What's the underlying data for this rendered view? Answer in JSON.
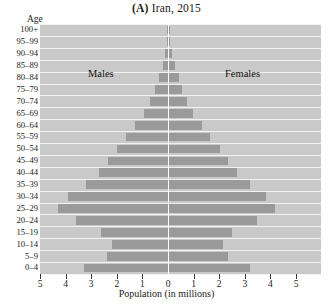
{
  "chart_data": {
    "type": "bar",
    "subtype": "population-pyramid",
    "title": "(A) Iran, 2015",
    "title_tag": "(A)",
    "title_rest": " Iran, 2015",
    "xlabel": "Population (in millions)",
    "ylabel": "Age",
    "xlim": [
      -5,
      5
    ],
    "xticks": [
      5,
      4,
      3,
      2,
      1,
      0,
      1,
      2,
      3,
      4,
      5
    ],
    "grid": true,
    "legend_position": "inside-plot",
    "categories": [
      "0–4",
      "5–9",
      "10–14",
      "15–19",
      "20–24",
      "25–29",
      "30–34",
      "35–39",
      "40–44",
      "45–49",
      "50–54",
      "55–59",
      "60–64",
      "65–69",
      "70–74",
      "75–79",
      "80–84",
      "85–89",
      "90–94",
      "95–99",
      "100+"
    ],
    "series": [
      {
        "name": "Males",
        "values": [
          3.3,
          2.4,
          2.2,
          2.6,
          3.6,
          4.3,
          3.9,
          3.2,
          2.7,
          2.35,
          2.0,
          1.65,
          1.3,
          0.95,
          0.7,
          0.5,
          0.36,
          0.2,
          0.1,
          0.04,
          0.01
        ]
      },
      {
        "name": "Females",
        "values": [
          3.15,
          2.3,
          2.1,
          2.45,
          3.45,
          4.15,
          3.8,
          3.15,
          2.65,
          2.3,
          1.98,
          1.62,
          1.3,
          0.95,
          0.72,
          0.52,
          0.38,
          0.22,
          0.11,
          0.04,
          0.01
        ]
      }
    ],
    "colors": {
      "bar": "#9a9a9a",
      "plot_background": "#c9c9c9",
      "gridline": "#f2f2f2",
      "centerline": "#fdfdfd",
      "text": "#1a1a1a"
    }
  },
  "labels": {
    "males": "Males",
    "females": "Females"
  }
}
